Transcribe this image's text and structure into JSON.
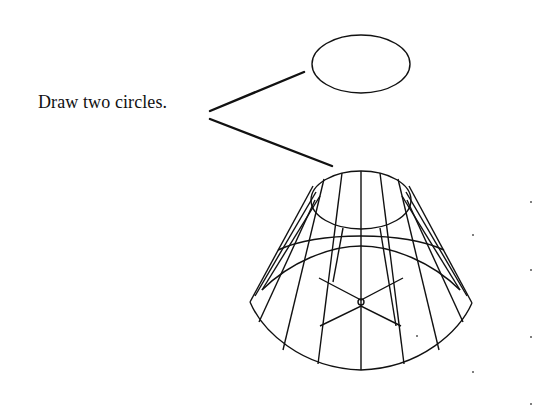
{
  "annotation": {
    "text": "Draw two circles.",
    "leader_count": 2
  },
  "figure": {
    "objects": [
      "top-circle",
      "frustum"
    ],
    "colors": {
      "stroke": "#111111",
      "background": "#ffffff",
      "grid_dot": "#555555"
    }
  }
}
